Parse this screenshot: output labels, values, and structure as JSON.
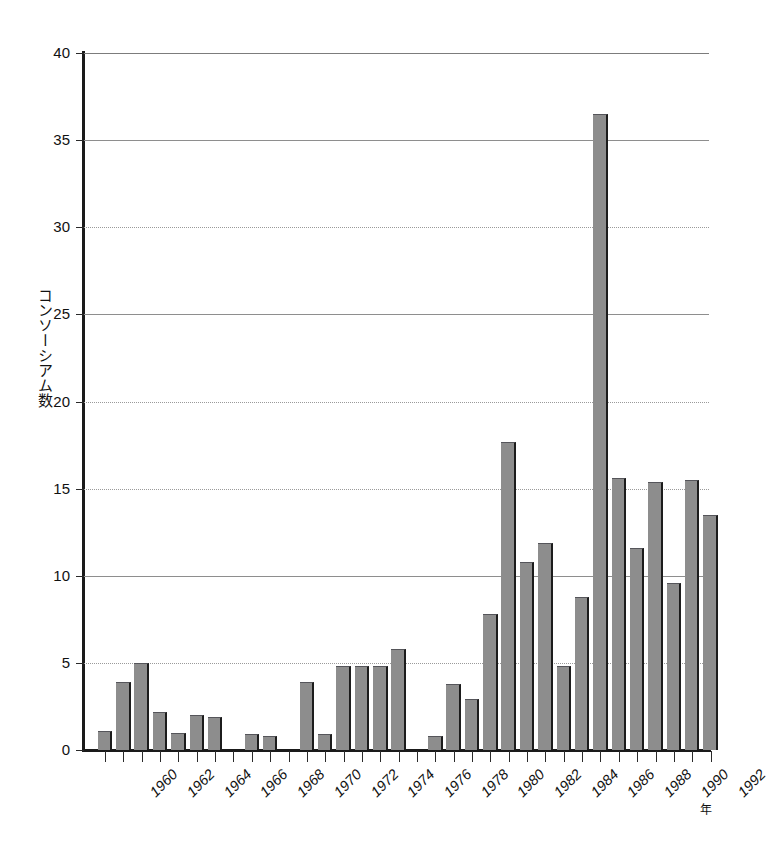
{
  "chart_data": {
    "type": "bar",
    "title": "",
    "xlabel": "年",
    "ylabel": "コンソーシアム数",
    "ylim": [
      0,
      40
    ],
    "ytick_values": [
      0,
      5,
      10,
      15,
      20,
      25,
      30,
      35,
      40
    ],
    "ytick_labels": [
      "0",
      "5",
      "10",
      "15",
      "20",
      "25",
      "30",
      "35",
      "40"
    ],
    "grid": true,
    "legend": "none",
    "xtick_labels": [
      "1960",
      "1962",
      "1964",
      "1966",
      "1968",
      "1970",
      "1972",
      "1974",
      "1976",
      "1978",
      "1980",
      "1982",
      "1984",
      "1986",
      "1988",
      "1990",
      "1992"
    ],
    "categories": [
      "1959",
      "1960",
      "1961",
      "1962",
      "1963",
      "1964",
      "1965",
      "1966",
      "1967",
      "1968",
      "1969",
      "1970",
      "1971",
      "1972",
      "1973",
      "1974",
      "1975",
      "1976",
      "1977",
      "1978",
      "1979",
      "1980",
      "1981",
      "1982",
      "1983",
      "1984",
      "1985",
      "1986",
      "1987",
      "1988",
      "1989",
      "1990",
      "1991",
      "1992"
    ],
    "values": [
      1.1,
      3.9,
      5.0,
      2.2,
      1.0,
      2.0,
      1.9,
      0.0,
      0.9,
      0.8,
      0.0,
      3.9,
      0.9,
      4.8,
      4.8,
      4.8,
      5.8,
      0.0,
      0.8,
      3.8,
      2.9,
      7.8,
      17.7,
      10.8,
      11.9,
      4.8,
      8.8,
      36.5,
      15.6,
      11.6,
      15.4,
      9.6,
      15.5,
      13.5
    ],
    "bar_color": "#8d8d8d",
    "bar_edge_color": "#1c1c1c"
  },
  "axis": {
    "y_title": "コンソーシアム数",
    "x_unit": "年"
  }
}
